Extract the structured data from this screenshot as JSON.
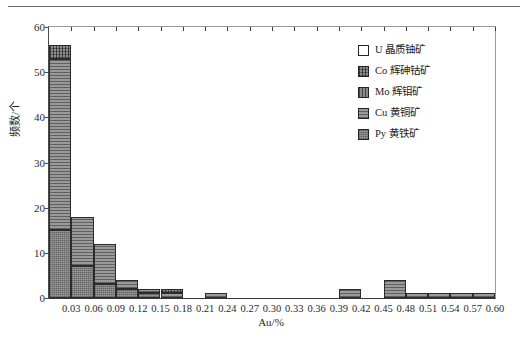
{
  "chart_data": {
    "type": "bar",
    "subtype": "stacked-histogram",
    "title": "",
    "xlabel": "Au/%",
    "ylabel": "频数/个",
    "xlim": [
      0.0,
      0.6
    ],
    "ylim": [
      0,
      60
    ],
    "ytick_step": 10,
    "yticks": [
      0,
      10,
      20,
      30,
      40,
      50,
      60
    ],
    "xticks": [
      0.03,
      0.06,
      0.09,
      0.12,
      0.15,
      0.18,
      0.21,
      0.24,
      0.27,
      0.3,
      0.33,
      0.36,
      0.39,
      0.42,
      0.45,
      0.48,
      0.51,
      0.54,
      0.57,
      0.6
    ],
    "xtick_labels": [
      "0.03",
      "0.06",
      "0.09",
      "0.12",
      "0.15",
      "0.18",
      "0.21",
      "0.24",
      "0.27",
      "0.30",
      "0.33",
      "0.36",
      "0.39",
      "0.42",
      "0.45",
      "0.48",
      "0.51",
      "0.54",
      "0.57",
      "0.60"
    ],
    "bin_width": 0.03,
    "bin_starts": [
      0.0,
      0.03,
      0.06,
      0.09,
      0.12,
      0.15,
      0.18,
      0.21,
      0.24,
      0.27,
      0.3,
      0.33,
      0.36,
      0.39,
      0.42,
      0.45,
      0.48,
      0.51,
      0.54,
      0.57
    ],
    "grid": false,
    "legend_position": "top-right",
    "series": [
      {
        "name": "Py 黄铁矿",
        "key": "py",
        "pattern": "fine-crosshatch",
        "values": [
          15,
          7,
          3,
          2,
          1,
          0,
          0,
          0,
          0,
          0,
          0,
          0,
          0,
          0,
          0,
          0,
          0,
          0,
          0,
          0
        ]
      },
      {
        "name": "Cu 黄铜矿",
        "key": "cu",
        "pattern": "horizontal-lines",
        "values": [
          38,
          11,
          9,
          2,
          1,
          1,
          0,
          1,
          0,
          0,
          0,
          0,
          0,
          2,
          0,
          4,
          1,
          1,
          1,
          1
        ]
      },
      {
        "name": "Mo 辉钼矿",
        "key": "mo",
        "pattern": "vertical-lines",
        "values": [
          0,
          0,
          0,
          0,
          0,
          0,
          0,
          0,
          0,
          0,
          0,
          0,
          0,
          0,
          0,
          0,
          0,
          0,
          0,
          0
        ]
      },
      {
        "name": "Co 辉砷钴矿",
        "key": "co",
        "pattern": "crosshatch",
        "values": [
          3,
          0,
          0,
          0,
          0,
          1,
          0,
          0,
          0,
          0,
          0,
          0,
          0,
          0,
          0,
          0,
          0,
          0,
          0,
          0
        ]
      },
      {
        "name": "U 晶质铀矿",
        "key": "u",
        "pattern": "solid-white",
        "values": [
          0,
          0,
          0,
          0,
          0,
          0,
          0,
          0,
          0,
          0,
          0,
          0,
          0,
          0,
          0,
          0,
          0,
          0,
          0,
          0
        ]
      }
    ],
    "totals": [
      56,
      18,
      12,
      4,
      2,
      2,
      0,
      1,
      0,
      0,
      0,
      0,
      0,
      2,
      0,
      4,
      1,
      1,
      1,
      1
    ]
  },
  "legend": {
    "items": [
      {
        "label": "U  晶质铀矿",
        "key": "u"
      },
      {
        "label": "Co 辉砷钴矿",
        "key": "co"
      },
      {
        "label": "Mo 辉钼矿",
        "key": "mo"
      },
      {
        "label": "Cu 黄铜矿",
        "key": "cu"
      },
      {
        "label": "Py 黄铁矿",
        "key": "py"
      }
    ]
  },
  "axis": {
    "x_title": "Au/%",
    "y_title": "频数/个"
  },
  "colors": {
    "frame": "#3a3a3a",
    "bar_outline": "#2b2b2b",
    "text": "#1a1a1a",
    "rule": "#6d6d6d"
  }
}
